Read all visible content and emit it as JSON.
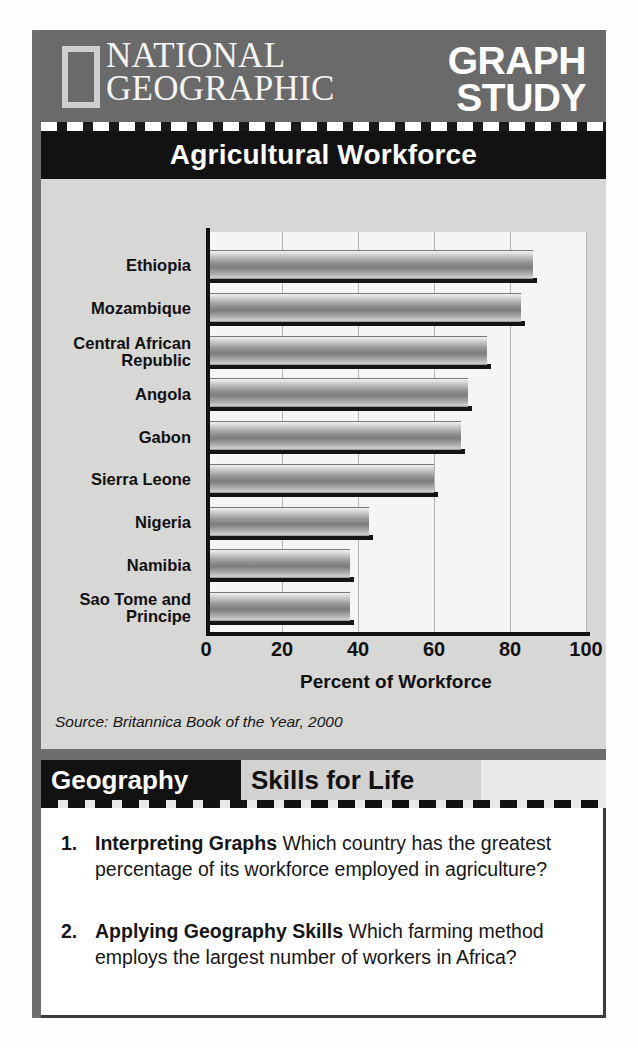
{
  "header": {
    "brand_line1": "NATIONAL",
    "brand_line2": "GEOGRAPHIC",
    "feature_line1": "GRAPH",
    "feature_line2": "STUDY",
    "logo_icon": "national-geographic-rectangle-icon"
  },
  "chart_title": "Agricultural Workforce",
  "source": "Source: Britannica Book of the Year, 2000",
  "skills": {
    "tag": "Geography",
    "title": "Skills for Life"
  },
  "questions": [
    {
      "number": "1.",
      "lead": "Interpreting Graphs",
      "text": " Which country has the greatest percentage of its workforce employed in agriculture?"
    },
    {
      "number": "2.",
      "lead": "Applying Geography Skills",
      "text": " Which farming method employs the largest number of workers in Africa?"
    }
  ],
  "colors": {
    "header_band": "#6a6a6a",
    "title_bar": "#121212",
    "chart_panel": "#d7d7d5",
    "plot_background": "#f5f5f4",
    "bar_mid": "#7c7c7c",
    "page": "#fdfdfb"
  },
  "chart_data": {
    "type": "bar",
    "orientation": "horizontal",
    "title": "Agricultural Workforce",
    "xlabel": "Percent of Workforce",
    "ylabel": "",
    "xlim": [
      0,
      100
    ],
    "xticks": [
      "0",
      "20",
      "40",
      "60",
      "80",
      "100"
    ],
    "grid": true,
    "legend": false,
    "source": "Source: Britannica Book of the Year, 2000",
    "categories": [
      "Ethiopia",
      "Mozambique",
      "Central African\nRepublic",
      "Angola",
      "Gabon",
      "Sierra Leone",
      "Nigeria",
      "Namibia",
      "Sao Tome and\nPrincipe"
    ],
    "values": [
      86,
      83,
      74,
      69,
      67,
      60,
      43,
      38,
      38
    ]
  }
}
